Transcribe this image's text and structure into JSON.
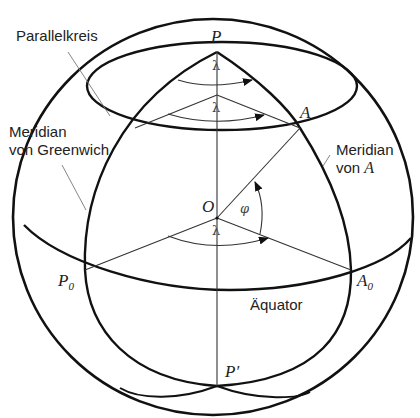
{
  "diagram": {
    "type": "sphere-geographic-coordinates",
    "colors": {
      "stroke": "#111111",
      "thin_stroke": "#555555",
      "background": "#ffffff"
    },
    "labels": {
      "parallelkreis": "Parallelkreis",
      "meridian_greenwich_line1": "Meridian",
      "meridian_greenwich_line2": "von Greenwich",
      "meridian_a_line1": "Meridian",
      "meridian_a_line2_prefix": "von ",
      "meridian_a_line2_var": "A",
      "aequator": "Äquator"
    },
    "points": {
      "north_pole": "P",
      "south_pole": "P′",
      "center": "O",
      "point_a": "A",
      "point_p0_base": "P",
      "point_p0_sub": "0",
      "point_a0_base": "A",
      "point_a0_sub": "0"
    },
    "angles": {
      "longitude_top": "λ",
      "longitude_parallel": "λ",
      "longitude_equator": "λ",
      "latitude": "φ"
    }
  }
}
